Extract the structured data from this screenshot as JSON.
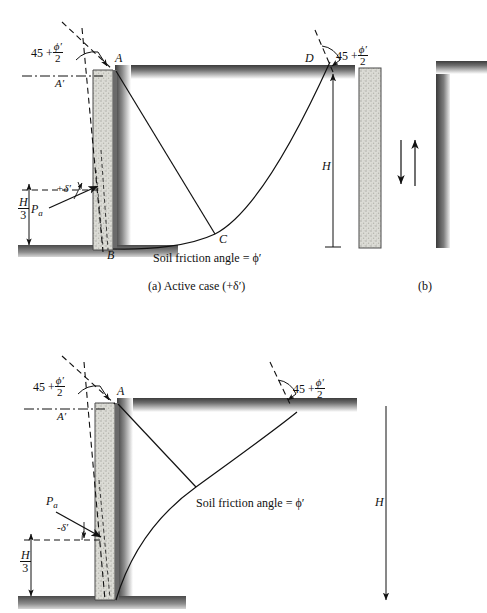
{
  "figure": {
    "title_implicit": "Retaining wall active earth pressure with wall friction",
    "panels": [
      {
        "id": "a",
        "caption": "(a) Active case (+δ′)",
        "caption_parts": {
          "tag": "(a)",
          "text": "Active case (+δ′)"
        },
        "labels": {
          "angle_left": {
            "base": "45 +",
            "num": "ϕ′",
            "den": "2"
          },
          "angle_right": {
            "base": "45 +",
            "num": "ϕ′",
            "den": "2"
          },
          "point_A": "A",
          "point_A_prime": "A′",
          "point_B": "B",
          "point_C": "C",
          "point_D": "D",
          "height": "H",
          "third_height": {
            "num": "H",
            "den": "3"
          },
          "force": "P",
          "force_sub": "a",
          "delta": "+δ′",
          "soil_friction": "Soil friction angle = ϕ′"
        }
      },
      {
        "id": "b",
        "caption": "(b)",
        "caption_parts": {
          "tag": "(b)",
          "text": ""
        },
        "labels": {
          "arrow_down": "downward-movement-arrow",
          "arrow_up": "upward-movement-arrow"
        }
      },
      {
        "id": "c",
        "caption": "",
        "labels": {
          "angle_left": {
            "base": "45 +",
            "num": "ϕ′",
            "den": "2"
          },
          "angle_right": {
            "base": "45 +",
            "num": "ϕ′",
            "den": "2"
          },
          "point_A": "A",
          "point_A_prime": "A′",
          "height": "H",
          "third_height": {
            "num": "H",
            "den": "3"
          },
          "force": "P",
          "force_sub": "a",
          "delta": "-δ′",
          "soil_friction": "Soil friction angle = ϕ′"
        }
      }
    ],
    "colors": {
      "ink": "#111111",
      "wall_fill": "#d8d8d2",
      "ground_dark": "#4a4a4a",
      "ground_light": "#bdbdbd",
      "background": "#ffffff"
    }
  }
}
